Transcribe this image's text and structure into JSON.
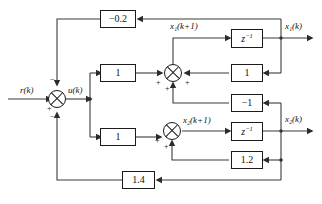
{
  "diagram": {
    "type": "control-block-diagram",
    "signals": {
      "reference": "r(k)",
      "control": "u(k)",
      "state1_next": "x₁(k+1)",
      "state1_out": "x₁(k)",
      "state2_next": "x₂(k+1)",
      "state2_out": "x₂(k)"
    },
    "blocks": [
      {
        "id": "gain-top-feedback",
        "label": "−0.2",
        "role": "outer-feedback-gain-x1"
      },
      {
        "id": "gain-forward-1",
        "label": "1",
        "role": "forward-gain-path-1"
      },
      {
        "id": "gain-forward-2",
        "label": "1",
        "role": "forward-gain-path-2"
      },
      {
        "id": "delay-1",
        "label": "z⁻¹",
        "role": "unit-delay-state-1"
      },
      {
        "id": "delay-2",
        "label": "z⁻¹",
        "role": "unit-delay-state-2"
      },
      {
        "id": "gain-state1-feedback",
        "label": "1",
        "role": "state-feedback-a11"
      },
      {
        "id": "gain-state2-to-sum1",
        "label": "−1",
        "role": "state-feedback-a12"
      },
      {
        "id": "gain-state2-feedback",
        "label": "1.2",
        "role": "state-feedback-a22"
      },
      {
        "id": "gain-bottom-feedback",
        "label": "1.4",
        "role": "outer-feedback-gain-x2"
      }
    ],
    "summers": [
      {
        "id": "summer-input",
        "signs": {
          "left": "+",
          "top": "−",
          "bottom": "−"
        }
      },
      {
        "id": "summer-state-1",
        "signs": {
          "left": "+",
          "right": "+",
          "bottom": "+"
        }
      },
      {
        "id": "summer-state-2",
        "signs": {
          "left": "+",
          "bottom": "+"
        }
      }
    ]
  }
}
